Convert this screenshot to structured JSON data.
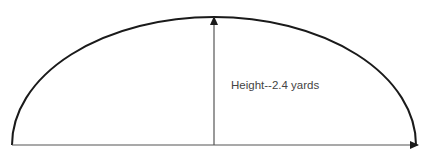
{
  "diagram": {
    "title": "",
    "height_label": "Height--2.4 yards",
    "shape": "semi-ellipse arch",
    "colors": {
      "stroke": "#1a1a1a",
      "line": "#555555",
      "text": "#444444"
    }
  }
}
